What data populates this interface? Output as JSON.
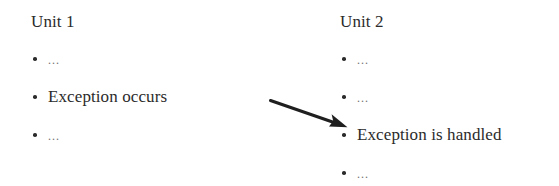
{
  "diagram": {
    "type": "two-column-bulleted-flow",
    "background_color": "#ffffff",
    "text_color": "#2b2b2b",
    "placeholder_color": "#6f6f6f",
    "arrow_color": "#1f1f1f",
    "columns": [
      {
        "title": "Unit 1",
        "items": [
          {
            "text": "...",
            "placeholder": true
          },
          {
            "text": "Exception occurs",
            "placeholder": false
          },
          {
            "text": "...",
            "placeholder": true
          }
        ]
      },
      {
        "title": "Unit 2",
        "items": [
          {
            "text": "...",
            "placeholder": true
          },
          {
            "text": "...",
            "placeholder": true
          },
          {
            "text": "Exception is handled",
            "placeholder": false
          },
          {
            "text": "...",
            "placeholder": true
          }
        ]
      }
    ],
    "connector": {
      "label": "",
      "from": "Exception occurs",
      "to": "Exception is handled",
      "style": "solid-diagonal-arrow"
    }
  }
}
